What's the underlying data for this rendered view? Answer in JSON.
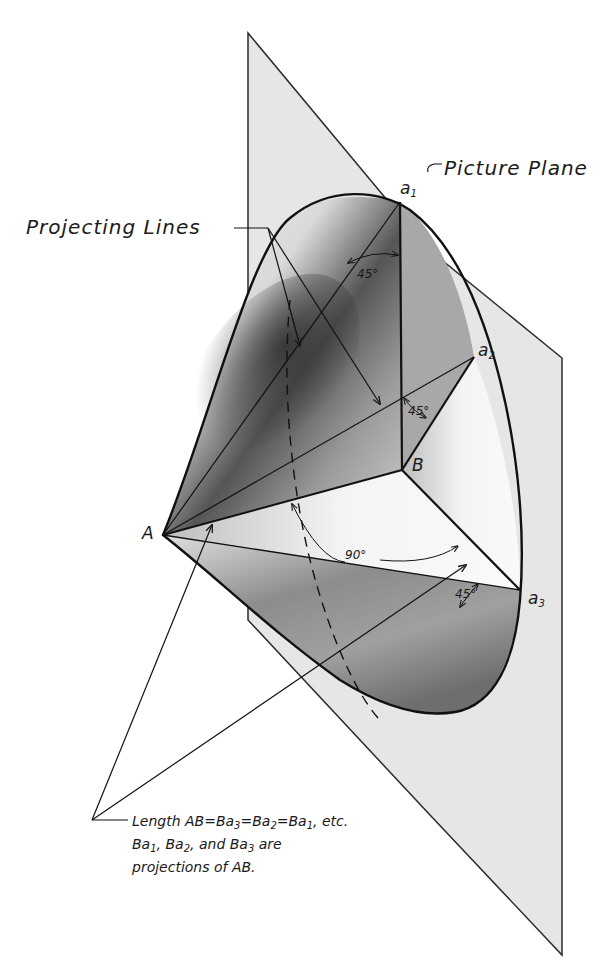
{
  "figure": {
    "labels": {
      "picture_plane": "Picture Plane",
      "projecting_lines": "Projecting Lines"
    },
    "points": {
      "A": "A",
      "B": "B",
      "a1": {
        "base": "a",
        "sub": "1"
      },
      "a2": {
        "base": "a",
        "sub": "2"
      },
      "a3": {
        "base": "a",
        "sub": "3"
      }
    },
    "angles": {
      "angle_a1": "45°",
      "angle_a2": "45°",
      "angle_right": "90°",
      "angle_a3": "45°"
    },
    "note": {
      "line1": {
        "prefix": "Length  AB=Ba",
        "s1": "3",
        "mid1": "=Ba",
        "s2": "2",
        "mid2": "=Ba",
        "s3": "1",
        "suffix": ",  etc."
      },
      "line2": {
        "p1": "Ba",
        "s1": "1",
        "p2": ", Ba",
        "s2": "2",
        "p3": ", and  Ba",
        "s3": "3",
        "p4": " are"
      },
      "line3": "projections  of AB."
    }
  }
}
